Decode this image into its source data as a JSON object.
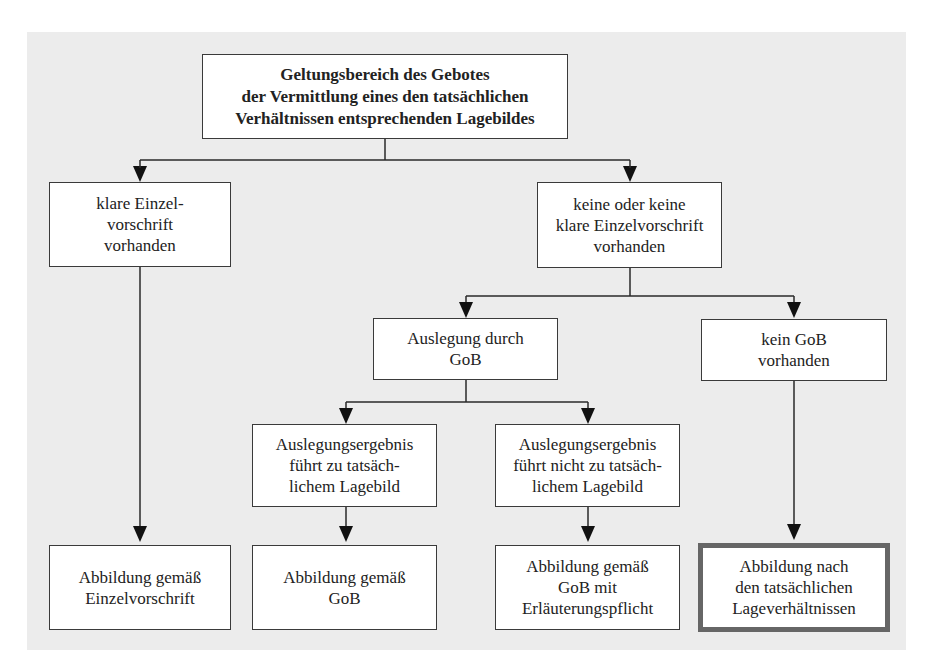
{
  "diagram": {
    "type": "decision-tree",
    "colors": {
      "panel_background": "#ececec",
      "box_background": "#ffffff",
      "box_border": "#3a3a3a",
      "highlight_border": "#666666",
      "text": "#222222"
    },
    "nodes": {
      "root": {
        "label": "Geltungsbereich des Gebotes\nder Vermittlung eines den tatsächlichen\nVerhältnissen entsprechenden Lagebildes"
      },
      "clear_rule": {
        "label": "klare Einzel-\nvorschrift\nvorhanden"
      },
      "no_clear_rule": {
        "label": "keine oder keine\nklare Einzelvorschrift\nvorhanden"
      },
      "interpretation_gob": {
        "label": "Auslegung durch\nGoB"
      },
      "no_gob": {
        "label": "kein GoB\nvorhanden"
      },
      "result_true_picture": {
        "label": "Auslegungsergebnis\nführt zu tatsäch-\nlichem Lagebild"
      },
      "result_not_true_picture": {
        "label": "Auslegungsergebnis\nführt nicht zu tatsäch-\nlichem Lagebild"
      },
      "outcome_single_rule": {
        "label": "Abbildung gemäß\nEinzelvorschrift"
      },
      "outcome_gob": {
        "label": "Abbildung gemäß\nGoB"
      },
      "outcome_gob_explanation": {
        "label": "Abbildung gemäß\nGoB mit\nErläuterungspflicht"
      },
      "outcome_actual": {
        "label": "Abbildung nach\nden tatsächlichen\nLageverhältnissen",
        "highlighted": true
      }
    },
    "edges": [
      [
        "root",
        "clear_rule"
      ],
      [
        "root",
        "no_clear_rule"
      ],
      [
        "no_clear_rule",
        "interpretation_gob"
      ],
      [
        "no_clear_rule",
        "no_gob"
      ],
      [
        "interpretation_gob",
        "result_true_picture"
      ],
      [
        "interpretation_gob",
        "result_not_true_picture"
      ],
      [
        "clear_rule",
        "outcome_single_rule"
      ],
      [
        "result_true_picture",
        "outcome_gob"
      ],
      [
        "result_not_true_picture",
        "outcome_gob_explanation"
      ],
      [
        "no_gob",
        "outcome_actual"
      ]
    ]
  }
}
